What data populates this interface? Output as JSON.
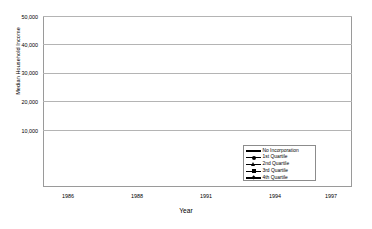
{
  "chart_data": {
    "type": "line",
    "title": "",
    "xlabel": "Year",
    "ylabel": "Median Household Income",
    "categories": [
      "1986",
      "1988",
      "1991",
      "1994",
      "1997"
    ],
    "x": [
      1986,
      1988,
      1991,
      1994,
      1997
    ],
    "ylim": [
      0,
      50000
    ],
    "yticks": [
      "10,000",
      "20,000",
      "30,000",
      "40,000",
      "50,000"
    ],
    "ytick_values": [
      10000,
      20000,
      30000,
      40000,
      50000
    ],
    "grid": true,
    "legend_position": "inside-bottom-right",
    "series": [
      {
        "name": "No Incorporation",
        "marker": "dash",
        "values": [
          15000,
          17500,
          18500,
          20000,
          21000
        ]
      },
      {
        "name": "1st Quartile",
        "marker": "circle",
        "values": [
          17000,
          21000,
          23500,
          26000,
          28500
        ]
      },
      {
        "name": "2nd Quartile",
        "marker": "triangle",
        "values": [
          22000,
          25500,
          30500,
          32000,
          34000
        ]
      },
      {
        "name": "3rd Quartile",
        "marker": "square",
        "values": [
          25000,
          29000,
          34000,
          36500,
          40000
        ]
      },
      {
        "name": "4th Quartile",
        "marker": "diamond",
        "values": [
          29000,
          33000,
          39000,
          42000,
          44000
        ]
      }
    ],
    "line_color": "#000000",
    "grid_color": "#b4b4b4",
    "frame_color": "#9a9a9a"
  }
}
